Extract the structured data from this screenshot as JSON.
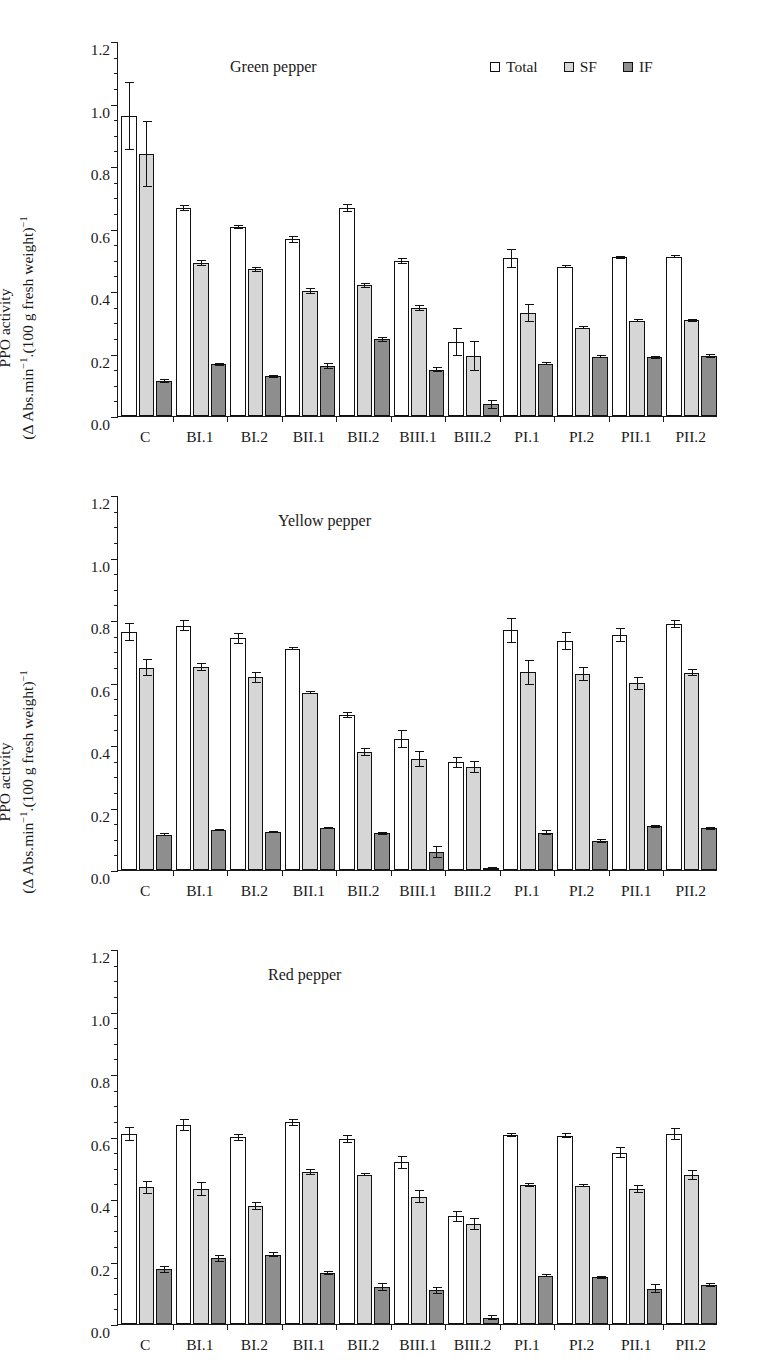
{
  "figure": {
    "y_axis_label_line1": "PPO activity",
    "y_axis_label_line2_prefix": "(Δ Abs.min",
    "y_axis_label_line2_mid": ".(100 g fresh weight)",
    "exponent": "−1",
    "legend": [
      {
        "key": "total",
        "label": "Total",
        "color": "#ffffff"
      },
      {
        "key": "sf",
        "label": "SF",
        "color": "#d6d6d6"
      },
      {
        "key": "if",
        "label": "IF",
        "color": "#8e8e8e"
      }
    ]
  },
  "chart_data": [
    {
      "type": "bar",
      "title": "Green pepper",
      "xlabel": "",
      "ylabel": "PPO activity (Δ Abs.min⁻¹.(100 g fresh weight)⁻¹)",
      "ylim": [
        0,
        1.2
      ],
      "yticks": [
        "0.0",
        "0.2",
        "0.4",
        "0.6",
        "0.8",
        "1.0",
        "1.2"
      ],
      "ytick_step": 0.2,
      "yminor_step": 0.05,
      "grid": false,
      "legend_position": "top-right",
      "categories": [
        "C",
        "BI.1",
        "BI.2",
        "BII.1",
        "BII.2",
        "BIII.1",
        "BIII.2",
        "PI.1",
        "PI.2",
        "PII.1",
        "PII.2"
      ],
      "series": [
        {
          "name": "Total",
          "values": [
            0.96,
            0.665,
            0.605,
            0.565,
            0.665,
            0.497,
            0.238,
            0.505,
            0.478,
            0.508,
            0.51
          ],
          "errors": [
            0.11,
            0.01,
            0.005,
            0.012,
            0.013,
            0.01,
            0.045,
            0.03,
            0.005,
            0.005,
            0.005
          ]
        },
        {
          "name": "SF",
          "values": [
            0.838,
            0.49,
            0.47,
            0.4,
            0.418,
            0.345,
            0.193,
            0.33,
            0.283,
            0.305,
            0.307
          ],
          "errors": [
            0.105,
            0.01,
            0.008,
            0.01,
            0.008,
            0.01,
            0.048,
            0.03,
            0.005,
            0.005,
            0.005
          ]
        },
        {
          "name": "IF",
          "values": [
            0.113,
            0.165,
            0.127,
            0.16,
            0.245,
            0.148,
            0.037,
            0.168,
            0.19,
            0.188,
            0.192
          ],
          "errors": [
            0.007,
            0.005,
            0.004,
            0.01,
            0.008,
            0.008,
            0.015,
            0.005,
            0.005,
            0.005,
            0.005
          ]
        }
      ]
    },
    {
      "type": "bar",
      "title": "Yellow pepper",
      "xlabel": "",
      "ylabel": "PPO activity (Δ Abs.min⁻¹.(100 g fresh weight)⁻¹)",
      "ylim": [
        0,
        1.2
      ],
      "yticks": [
        "0.0",
        "0.2",
        "0.4",
        "0.6",
        "0.8",
        "1.0",
        "1.2"
      ],
      "ytick_step": 0.2,
      "yminor_step": 0.05,
      "grid": false,
      "legend_position": "none",
      "categories": [
        "C",
        "BI.1",
        "BI.2",
        "BII.1",
        "BII.2",
        "BIII.1",
        "BIII.2",
        "PI.1",
        "PI.2",
        "PII.1",
        "PII.2"
      ],
      "series": [
        {
          "name": "Total",
          "values": [
            0.762,
            0.782,
            0.742,
            0.708,
            0.497,
            0.42,
            0.345,
            0.768,
            0.733,
            0.752,
            0.788
          ],
          "errors": [
            0.028,
            0.018,
            0.018,
            0.005,
            0.01,
            0.028,
            0.018,
            0.04,
            0.028,
            0.022,
            0.013
          ]
        },
        {
          "name": "SF",
          "values": [
            0.648,
            0.65,
            0.617,
            0.568,
            0.378,
            0.355,
            0.33,
            0.633,
            0.628,
            0.597,
            0.632
          ],
          "errors": [
            0.028,
            0.013,
            0.018,
            0.005,
            0.012,
            0.025,
            0.02,
            0.04,
            0.022,
            0.02,
            0.012
          ]
        },
        {
          "name": "IF",
          "values": [
            0.113,
            0.128,
            0.122,
            0.135,
            0.118,
            0.058,
            0.008,
            0.12,
            0.093,
            0.14,
            0.133
          ],
          "errors": [
            0.005,
            0.004,
            0.004,
            0.004,
            0.005,
            0.018,
            0.003,
            0.008,
            0.005,
            0.004,
            0.004
          ]
        }
      ]
    },
    {
      "type": "bar",
      "title": "Red  pepper",
      "xlabel": "",
      "ylabel": "PPO activity (Δ Abs.min⁻¹.(100 g fresh weight)⁻¹)",
      "ylim": [
        0,
        1.2
      ],
      "yticks": [
        "0.0",
        "0.2",
        "0.4",
        "0.6",
        "0.8",
        "1.0",
        "1.2"
      ],
      "ytick_step": 0.2,
      "yminor_step": 0.05,
      "grid": false,
      "legend_position": "none",
      "categories": [
        "C",
        "BI.1",
        "BI.2",
        "BII.1",
        "BII.2",
        "BIII.1",
        "BIII.2",
        "PI.1",
        "PI.2",
        "PII.1",
        "PII.2"
      ],
      "series": [
        {
          "name": "Total",
          "values": [
            0.607,
            0.637,
            0.597,
            0.645,
            0.592,
            0.517,
            0.345,
            0.605,
            0.603,
            0.548,
            0.608
          ],
          "errors": [
            0.022,
            0.02,
            0.01,
            0.012,
            0.012,
            0.02,
            0.018,
            0.007,
            0.007,
            0.018,
            0.02
          ]
        },
        {
          "name": "SF",
          "values": [
            0.437,
            0.432,
            0.378,
            0.487,
            0.478,
            0.408,
            0.32,
            0.445,
            0.442,
            0.432,
            0.477
          ],
          "errors": [
            0.022,
            0.022,
            0.012,
            0.01,
            0.005,
            0.02,
            0.018,
            0.006,
            0.005,
            0.012,
            0.015
          ]
        },
        {
          "name": "IF",
          "values": [
            0.175,
            0.21,
            0.222,
            0.163,
            0.118,
            0.108,
            0.02,
            0.155,
            0.15,
            0.113,
            0.125
          ],
          "errors": [
            0.012,
            0.01,
            0.008,
            0.007,
            0.012,
            0.012,
            0.008,
            0.005,
            0.005,
            0.015,
            0.005
          ]
        }
      ]
    }
  ]
}
